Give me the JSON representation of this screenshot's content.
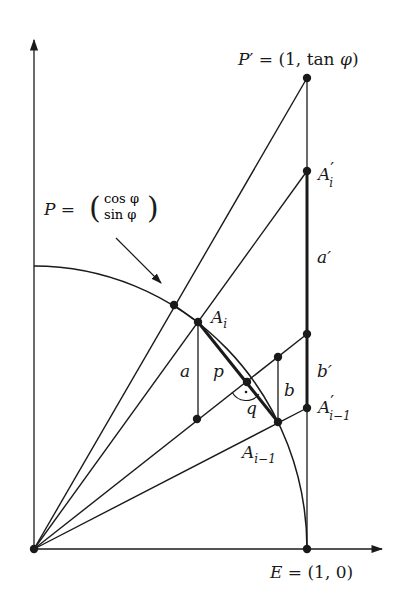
{
  "labels": {
    "p_prime": {
      "var": "P",
      "prime": "′",
      "eq": " = (1, ",
      "fn": "tan",
      "phi": " φ",
      "close": ")"
    },
    "p_eq": {
      "var": "P",
      "eq": " = "
    },
    "p_vec_top": "cos φ",
    "p_vec_bot": "sin φ",
    "a_i_prime": {
      "base": "A",
      "prime": "′",
      "sub": "i"
    },
    "a_prime": "a′",
    "a_i": {
      "base": "A",
      "sub": "i"
    },
    "a": "a",
    "p": "p",
    "q": "q",
    "b": "b",
    "b_prime": "b′",
    "a_im1_prime": {
      "base": "A",
      "prime": "′",
      "sub": "i−1"
    },
    "a_im1": {
      "base": "A",
      "sub": "i−1"
    },
    "e": {
      "var": "E",
      "eq": " = (1, 0)"
    }
  },
  "points": [
    {
      "name": "O",
      "label": "origin"
    },
    {
      "name": "E",
      "label": "E = (1,0)"
    },
    {
      "name": "P",
      "label": "P = (cos φ, sin φ)"
    },
    {
      "name": "P'",
      "label": "P' = (1, tan φ)"
    },
    {
      "name": "A_i",
      "label": "A_i"
    },
    {
      "name": "A_{i-1}",
      "label": "A_{i-1}"
    },
    {
      "name": "A'_i",
      "label": "A'_i"
    },
    {
      "name": "A'_{i-1}",
      "label": "A'_{i-1}"
    }
  ],
  "colors": {
    "ink": "#1a1a1a",
    "background": "#ffffff"
  }
}
